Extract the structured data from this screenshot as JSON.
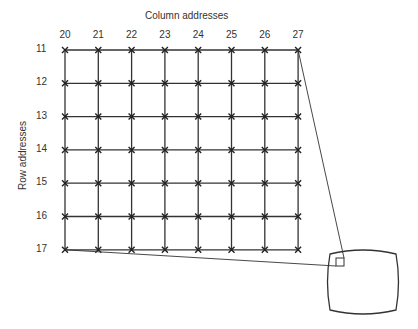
{
  "diagram": {
    "title": "Column addresses",
    "ylabel": "Row addresses",
    "columns": [
      "20",
      "21",
      "22",
      "23",
      "24",
      "25",
      "26",
      "27"
    ],
    "rows": [
      "11",
      "12",
      "13",
      "14",
      "15",
      "16",
      "17"
    ]
  }
}
